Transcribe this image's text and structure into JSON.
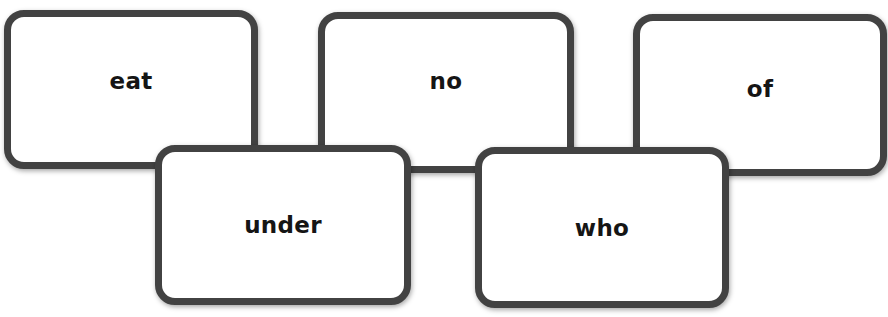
{
  "cards": [
    {
      "id": "eat",
      "word": "eat"
    },
    {
      "id": "no",
      "word": "no"
    },
    {
      "id": "of",
      "word": "of"
    },
    {
      "id": "under",
      "word": "under"
    },
    {
      "id": "who",
      "word": "who"
    }
  ],
  "colors": {
    "border": "#424242",
    "text": "#151515",
    "background": "#ffffff"
  }
}
